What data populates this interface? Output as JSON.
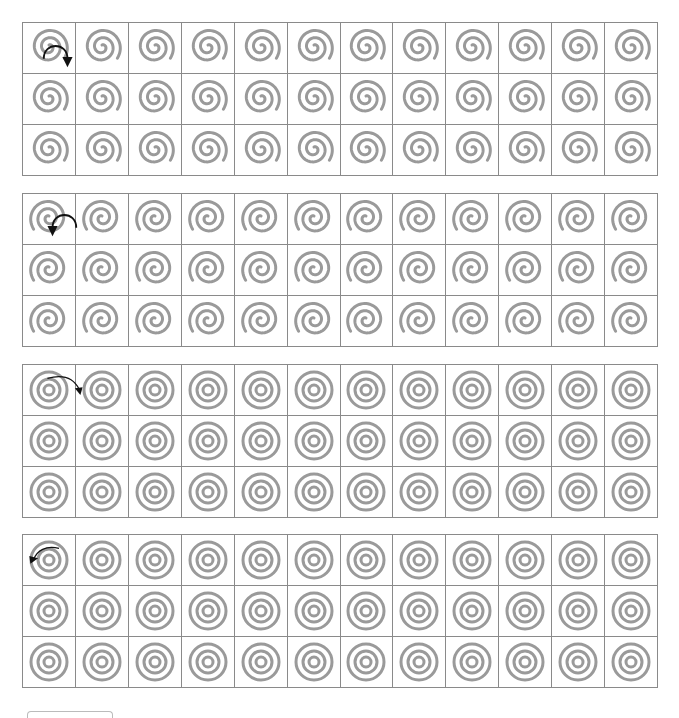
{
  "worksheet": {
    "columns": 12,
    "rows_per_block": 3,
    "colors": {
      "grid_line": "#8a8a8a",
      "trace_stroke": "#9a9a9a",
      "arrow": "#111111",
      "background": "#ffffff"
    },
    "blocks": [
      {
        "id": "spiral-clockwise",
        "shape": "spiral",
        "direction": "clockwise",
        "top": 22
      },
      {
        "id": "spiral-counterclockwise",
        "shape": "spiral",
        "direction": "counterclockwise",
        "top": 193
      },
      {
        "id": "circles-clockwise",
        "shape": "concentric-circles",
        "direction": "clockwise",
        "top": 364
      },
      {
        "id": "circles-counterclockwise",
        "shape": "concentric-circles",
        "direction": "counterclockwise",
        "top": 534
      }
    ]
  }
}
